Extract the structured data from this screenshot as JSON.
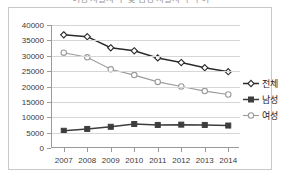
{
  "title_cropped": "여성 자살자 수 및 남성 자살자 수 추이",
  "legend": {
    "position": "right",
    "items": [
      {
        "label": "전체",
        "marker": "diamond",
        "color": "#2b2b2b"
      },
      {
        "label": "남성",
        "marker": "square",
        "color": "#3d3d3d"
      },
      {
        "label": "여성",
        "marker": "open-circle",
        "color": "#9b9b9b"
      }
    ]
  },
  "axes": {
    "y_ticks": [
      "40000",
      "35000",
      "30000",
      "25000",
      "20000",
      "15000",
      "10000",
      "5000",
      "0"
    ],
    "x_ticks": [
      "2007",
      "2008",
      "2009",
      "2010",
      "2011",
      "2012",
      "2013",
      "2014"
    ]
  },
  "chart_data": {
    "type": "line",
    "title": "여성 자살자 수 및 남성 자살자 수 추이",
    "xlabel": "",
    "ylabel": "",
    "x": [
      2007,
      2008,
      2009,
      2010,
      2011,
      2012,
      2013,
      2014
    ],
    "categories": [
      "2007",
      "2008",
      "2009",
      "2010",
      "2011",
      "2012",
      "2013",
      "2014"
    ],
    "ylim": [
      0,
      40000
    ],
    "ytick_step": 5000,
    "grid": true,
    "legend_position": "right",
    "series": [
      {
        "name": "전체",
        "marker": "diamond",
        "color": "#2b2b2b",
        "values": [
          36800,
          36200,
          32600,
          31600,
          29300,
          27800,
          26100,
          24800
        ]
      },
      {
        "name": "남성",
        "marker": "square",
        "color": "#3d3d3d",
        "values": [
          5600,
          6200,
          6900,
          7800,
          7500,
          7600,
          7500,
          7300
        ]
      },
      {
        "name": "여성",
        "marker": "open-circle",
        "color": "#9b9b9b",
        "values": [
          31000,
          29500,
          25600,
          23700,
          21500,
          20000,
          18500,
          17400
        ]
      }
    ]
  }
}
